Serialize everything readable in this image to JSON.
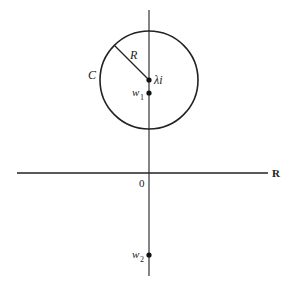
{
  "diagram": {
    "labels": {
      "radius": "R",
      "circle": "C",
      "center": "λi",
      "w1_base": "w",
      "w1_sub": "1",
      "w2_base": "w",
      "w2_sub": "2",
      "origin": "0",
      "real_axis": "R"
    },
    "colors": {
      "stroke": "#222222",
      "background": "#ffffff"
    }
  }
}
